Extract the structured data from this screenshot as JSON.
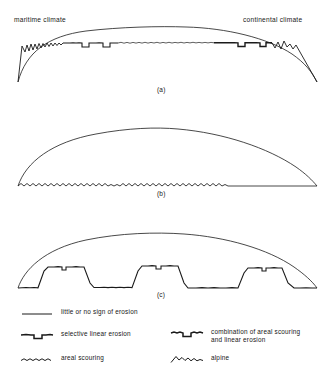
{
  "figure": {
    "panels": [
      {
        "id": "a",
        "label": "(a)",
        "left_annotation": "maritime climate",
        "right_annotation": "continental climate",
        "description": "Ice-sheet profile with alpine erosion at maritime margin, selective linear erosion, little or no erosion in centre, areal scouring and alpine erosion at continental margin"
      },
      {
        "id": "b",
        "label": "(b)",
        "description": "Smooth ice-sheet dome over areal scouring bed on left half, little or no erosion on right half"
      },
      {
        "id": "c",
        "label": "(c)",
        "description": "Ice-sheet profile over stepped terrain showing plateau uplands with combination of areal scouring and linear erosion"
      }
    ]
  },
  "legend": {
    "items": [
      {
        "key": "none",
        "symbol": "straight-line-symbol",
        "label": "little or no sign of erosion"
      },
      {
        "key": "select",
        "symbol": "selective-linear-erosion-symbol",
        "label": "selective linear erosion"
      },
      {
        "key": "areal",
        "symbol": "areal-scouring-symbol",
        "label": "areal  scouring"
      },
      {
        "key": "combo",
        "symbol": "combination-symbol",
        "label": "combination of areal scouring\nand linear erosion"
      },
      {
        "key": "alpine",
        "symbol": "alpine-symbol",
        "label": "alpine"
      }
    ]
  },
  "colors": {
    "ink": "#1a1a1a",
    "background": "#ffffff"
  }
}
